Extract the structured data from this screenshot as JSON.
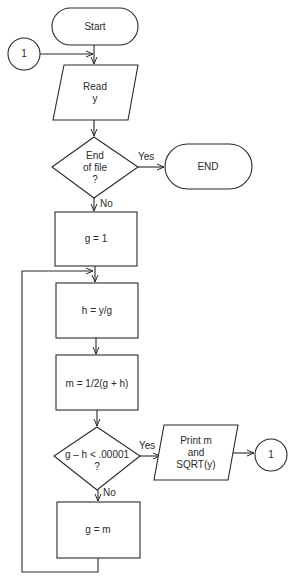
{
  "diagram": {
    "type": "flowchart",
    "nodes": [
      {
        "id": "start",
        "shape": "terminal",
        "label": "Start"
      },
      {
        "id": "connector_in",
        "shape": "connector",
        "label": "1"
      },
      {
        "id": "read",
        "shape": "io",
        "label": "Read\ny"
      },
      {
        "id": "eof",
        "shape": "decision",
        "label": "End\nof file\n?"
      },
      {
        "id": "end",
        "shape": "terminal",
        "label": "END"
      },
      {
        "id": "g_init",
        "shape": "process",
        "label": "g = 1"
      },
      {
        "id": "h_calc",
        "shape": "process",
        "label": "h = y/g"
      },
      {
        "id": "m_calc",
        "shape": "process",
        "label": "m = 1/2(g + h)"
      },
      {
        "id": "converge",
        "shape": "decision",
        "label": "g – h < .00001\n?"
      },
      {
        "id": "print",
        "shape": "io",
        "label": "Print m\nand\nSQRT(y)"
      },
      {
        "id": "connector_out",
        "shape": "connector",
        "label": "1"
      },
      {
        "id": "g_update",
        "shape": "process",
        "label": "g = m"
      }
    ],
    "edges": [
      {
        "from": "start",
        "to": "read",
        "label": ""
      },
      {
        "from": "connector_in",
        "to": "read",
        "label": ""
      },
      {
        "from": "read",
        "to": "eof",
        "label": ""
      },
      {
        "from": "eof",
        "to": "end",
        "label": "Yes"
      },
      {
        "from": "eof",
        "to": "g_init",
        "label": "No"
      },
      {
        "from": "g_init",
        "to": "h_calc",
        "label": ""
      },
      {
        "from": "h_calc",
        "to": "m_calc",
        "label": ""
      },
      {
        "from": "m_calc",
        "to": "converge",
        "label": ""
      },
      {
        "from": "converge",
        "to": "print",
        "label": "Yes"
      },
      {
        "from": "print",
        "to": "connector_out",
        "label": ""
      },
      {
        "from": "converge",
        "to": "g_update",
        "label": "No"
      },
      {
        "from": "g_update",
        "to": "h_calc",
        "label": ""
      }
    ]
  },
  "labels": {
    "start": "Start",
    "connector_in": "1",
    "read": "Read\ny",
    "eof": "End\nof file\n?",
    "end": "END",
    "g_init": "g = 1",
    "h_calc": "h = y/g",
    "m_calc": "m = 1/2(g + h)",
    "converge": "g – h < .00001\n?",
    "print": "Print m\nand\nSQRT(y)",
    "connector_out": "1",
    "g_update": "g = m",
    "eof_yes": "Yes",
    "eof_no": "No",
    "converge_yes": "Yes",
    "converge_no": "No"
  },
  "colors": {
    "stroke": "#2a2a2a",
    "background": "#ffffff"
  }
}
